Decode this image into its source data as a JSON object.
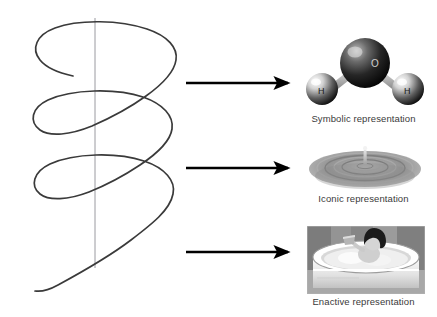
{
  "figure": {
    "background_color": "#ffffff",
    "width": 437,
    "height": 317
  },
  "spiral": {
    "name": "spiral-helix",
    "stroke_color": "#3a3a3a",
    "axis_color": "#9a9aa0",
    "coil_count": 3
  },
  "arrows": [
    {
      "label": "arrow-to-symbolic",
      "color": "#000000"
    },
    {
      "label": "arrow-to-iconic",
      "color": "#000000"
    },
    {
      "label": "arrow-to-enactive",
      "color": "#000000"
    }
  ],
  "representations": [
    {
      "id": "symbolic",
      "caption": "Symbolic representation",
      "illustration": "water-molecule-diagram",
      "atoms": [
        {
          "symbol": "O",
          "role": "oxygen",
          "color": "#1c1c1c"
        },
        {
          "symbol": "H",
          "role": "hydrogen",
          "color": "#d9d9d9"
        },
        {
          "symbol": "H",
          "role": "hydrogen",
          "color": "#d9d9d9"
        }
      ]
    },
    {
      "id": "iconic",
      "caption": "Iconic representation",
      "illustration": "water-ripple-photo",
      "color": "#8d8d8d"
    },
    {
      "id": "enactive",
      "caption": "Enactive representation",
      "illustration": "child-in-bathtub-photo",
      "color": "#9a9a9a"
    }
  ]
}
